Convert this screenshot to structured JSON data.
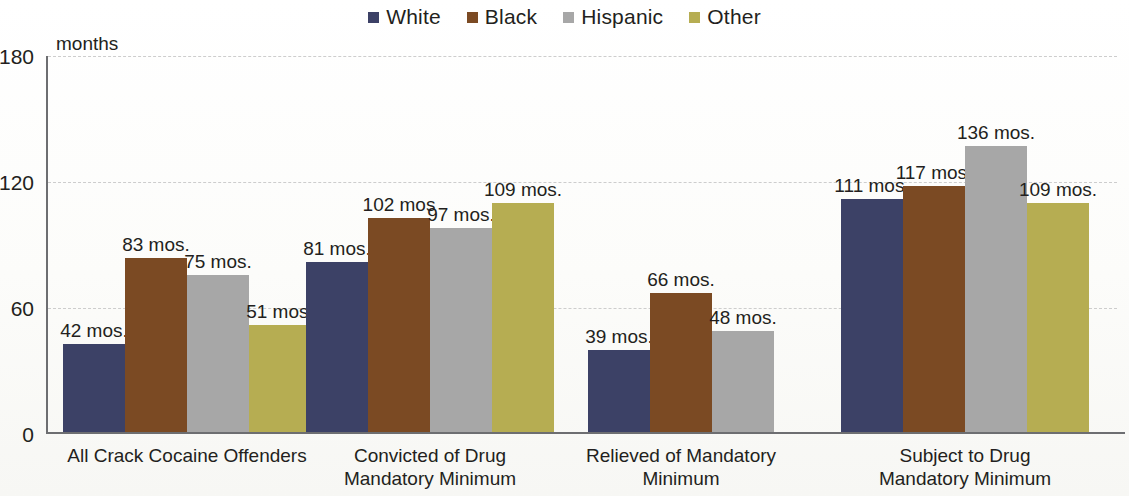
{
  "legend": {
    "items": [
      {
        "label": "White",
        "color": "#3c4166"
      },
      {
        "label": "Black",
        "color": "#7b4a23"
      },
      {
        "label": "Hispanic",
        "color": "#a7a7a7"
      },
      {
        "label": "Other",
        "color": "#b6ad52"
      }
    ]
  },
  "axis": {
    "unit_label": "months",
    "y_ticks": [
      "180",
      "120",
      "60",
      "0"
    ]
  },
  "chart_data": {
    "type": "bar",
    "title": "",
    "subtitle": "",
    "xlabel": "",
    "ylabel": "months",
    "ylim": [
      0,
      180
    ],
    "yticks": [
      0,
      60,
      120,
      180
    ],
    "grid": true,
    "legend_position": "top-center",
    "value_suffix": "mos.",
    "categories": [
      "All Crack Cocaine Offenders",
      "Convicted of Drug Mandatory Minimum",
      "Relieved of Mandatory Minimum",
      "Subject to Drug Mandatory Minimum"
    ],
    "category_lines": [
      [
        "All Crack Cocaine Offenders"
      ],
      [
        "Convicted of Drug",
        "Mandatory Minimum"
      ],
      [
        "Relieved of Mandatory",
        "Minimum"
      ],
      [
        "Subject to Drug",
        "Mandatory Minimum"
      ]
    ],
    "series": [
      {
        "name": "White",
        "color": "#3c4166",
        "values": [
          42,
          81,
          39,
          111
        ]
      },
      {
        "name": "Black",
        "color": "#7b4a23",
        "values": [
          83,
          102,
          66,
          117
        ]
      },
      {
        "name": "Hispanic",
        "color": "#a7a7a7",
        "values": [
          75,
          97,
          48,
          136
        ]
      },
      {
        "name": "Other",
        "color": "#b6ad52",
        "values": [
          51,
          109,
          null,
          109
        ]
      }
    ],
    "point_labels": [
      [
        "42 mos.",
        "83 mos.",
        "75 mos.",
        "51 mos."
      ],
      [
        "81 mos.",
        "102 mos",
        "97 mos.",
        "109 mos."
      ],
      [
        "39 mos.",
        "66 mos.",
        "48 mos.",
        null
      ],
      [
        "111 mos.",
        "117 mos.",
        "136 mos.",
        "109 mos."
      ]
    ]
  }
}
